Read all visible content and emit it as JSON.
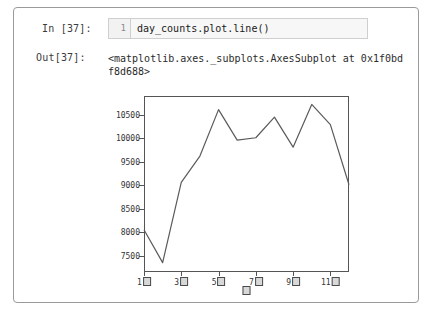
{
  "cell": {
    "in_prompt": "In [37]:",
    "out_prompt": "Out[37]:",
    "line_number": "1",
    "code": "day_counts.plot.line()",
    "output_text": "<matplotlib.axes._subplots.AxesSubplot at 0x1f0bdf8d688>"
  },
  "colors": {
    "line": "#5a5a5a",
    "frame": "#555555",
    "cell_border": "#9a9a9a",
    "editor_bg": "#f7f7f7",
    "gutter_bg": "#f2f2f2"
  },
  "chart_data": {
    "type": "line",
    "title": "",
    "xlabel": "□",
    "ylabel": "",
    "x": [
      1,
      2,
      3,
      4,
      5,
      6,
      7,
      8,
      9,
      10,
      11,
      12
    ],
    "categories": [
      "1□",
      "2□",
      "3□",
      "4□",
      "5□",
      "6□",
      "7□",
      "8□",
      "9□",
      "10□",
      "11□",
      "12□"
    ],
    "values": [
      8050,
      7350,
      9060,
      9620,
      10610,
      9960,
      10010,
      10450,
      9810,
      10720,
      10290,
      9010
    ],
    "series": [
      {
        "name": "day_counts",
        "values": [
          8050,
          7350,
          9060,
          9620,
          10610,
          9960,
          10010,
          10450,
          9810,
          10720,
          10290,
          9010
        ]
      }
    ],
    "ylim": [
      7150,
      10900
    ],
    "xlim": [
      1,
      12
    ],
    "yticks": [
      7500,
      8000,
      8500,
      9000,
      9500,
      10000,
      10500
    ],
    "ytick_labels": [
      "7500",
      "8000",
      "8500",
      "9000",
      "9500",
      "10000",
      "10500"
    ],
    "xticks": [
      1,
      3,
      5,
      7,
      9,
      11
    ],
    "xtick_labels": [
      "1",
      "3",
      "5",
      "7",
      "9",
      "11"
    ],
    "grid": false,
    "legend": false,
    "legend_position": "none"
  }
}
